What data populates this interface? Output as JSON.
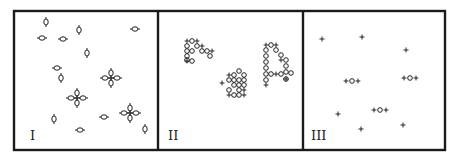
{
  "figure": {
    "colors": {
      "ink": "#1a1a1a",
      "background": "#ffffff"
    },
    "frame": {
      "x": 14,
      "y": 11,
      "width": 431,
      "height": 139
    },
    "dividers_x": [
      158,
      303
    ],
    "panels": [
      {
        "id": "I",
        "label": "I",
        "label_pos": [
          30,
          140
        ],
        "description": "dispersed single particles with a few four-fold clusters",
        "singles": [
          [
            46,
            22
          ],
          [
            42,
            38
          ],
          [
            63,
            39
          ],
          [
            79,
            30
          ],
          [
            87,
            53
          ],
          [
            135,
            29
          ],
          [
            57,
            68
          ],
          [
            61,
            78
          ],
          [
            54,
            119
          ],
          [
            80,
            130
          ],
          [
            104,
            117
          ],
          [
            145,
            129
          ]
        ],
        "clusters": [
          [
            111,
            78
          ],
          [
            77,
            98
          ],
          [
            130,
            113
          ]
        ]
      },
      {
        "id": "II",
        "label": "II",
        "label_pos": [
          168,
          140
        ],
        "description": "aggregated particle clusters",
        "aggregates": [
          {
            "name": "aggregate-left",
            "rings": [
              [
                192,
                41
              ],
              [
                187,
                46
              ],
              [
                197,
                46
              ],
              [
                187,
                51
              ],
              [
                192,
                51
              ],
              [
                202,
                51
              ],
              [
                207,
                51
              ],
              [
                187,
                56
              ],
              [
                210,
                56
              ],
              [
                187,
                60
              ],
              [
                192,
                61
              ]
            ],
            "plus": [
              [
                187,
                41
              ],
              [
                197,
                41
              ],
              [
                202,
                46
              ],
              [
                212,
                51
              ],
              [
                187,
                61
              ]
            ]
          },
          {
            "name": "aggregate-middle",
            "rings": [
              [
                239,
                71
              ],
              [
                234,
                75
              ],
              [
                244,
                75
              ],
              [
                229,
                80
              ],
              [
                234,
                80
              ],
              [
                239,
                80
              ],
              [
                244,
                80
              ],
              [
                234,
                85
              ],
              [
                239,
                85
              ],
              [
                244,
                85
              ],
              [
                229,
                90
              ],
              [
                239,
                90
              ],
              [
                234,
                95
              ],
              [
                239,
                95
              ]
            ],
            "plus": [
              [
                229,
                75
              ],
              [
                222,
                83
              ],
              [
                244,
                90
              ],
              [
                229,
                95
              ],
              [
                244,
                95
              ]
            ]
          },
          {
            "name": "aggregate-right",
            "rings": [
              [
                271,
                45
              ],
              [
                266,
                50
              ],
              [
                276,
                50
              ],
              [
                266,
                56
              ],
              [
                281,
                55
              ],
              [
                286,
                60
              ],
              [
                266,
                62
              ],
              [
                266,
                68
              ],
              [
                286,
                66
              ],
              [
                266,
                74
              ],
              [
                271,
                74
              ],
              [
                281,
                74
              ],
              [
                286,
                72
              ],
              [
                291,
                73
              ],
              [
                266,
                80
              ],
              [
                286,
                79
              ]
            ],
            "plus": [
              [
                266,
                45
              ],
              [
                276,
                45
              ],
              [
                281,
                60
              ],
              [
                276,
                74
              ],
              [
                286,
                79
              ],
              [
                266,
                85
              ]
            ]
          }
        ]
      },
      {
        "id": "III",
        "label": "III",
        "label_pos": [
          311,
          140
        ],
        "description": "small plus markers with a few ring-plus pairs",
        "plus": [
          [
            322,
            39
          ],
          [
            362,
            37
          ],
          [
            406,
            50
          ],
          [
            338,
            114
          ],
          [
            361,
            129
          ],
          [
            403,
            125
          ]
        ],
        "ring_pairs": [
          [
            352,
            81
          ],
          [
            410,
            78
          ],
          [
            380,
            110
          ]
        ]
      }
    ]
  }
}
